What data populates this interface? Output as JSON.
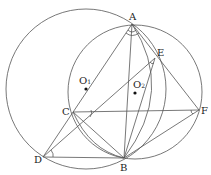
{
  "diagram": {
    "points": {
      "A": {
        "label": "A",
        "x": 132,
        "y": 24
      },
      "E": {
        "label": "E",
        "x": 155,
        "y": 58
      },
      "F": {
        "label": "F",
        "x": 199,
        "y": 110
      },
      "C": {
        "label": "C",
        "x": 73,
        "y": 112
      },
      "D": {
        "label": "D",
        "x": 43,
        "y": 157
      },
      "B": {
        "label": "B",
        "x": 124,
        "y": 158
      }
    },
    "centers": {
      "O1": {
        "label": "O",
        "sub": "1",
        "x": 86,
        "y": 89
      },
      "O2": {
        "label": "O",
        "sub": "2",
        "x": 135,
        "y": 93
      }
    },
    "stroke_color": "#555555"
  }
}
